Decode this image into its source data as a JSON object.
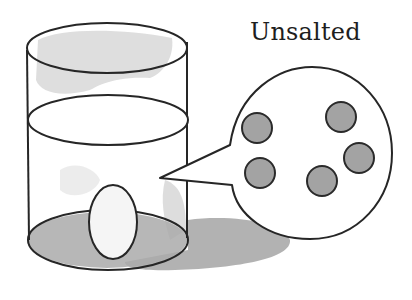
{
  "title": "Unsalted",
  "colors": {
    "background": "#ffffff",
    "outline": "#262626",
    "water_wash": "#d9d9d9",
    "shadow": "#9e9e9e",
    "bottom_fill": "#a8a8a8",
    "molecule_fill": "#a3a3a3",
    "egg_fill": "#f7f7f7"
  },
  "figure": {
    "glass": {
      "left": 27,
      "right": 188,
      "top_cy": 48,
      "water_cy": 120,
      "bottom_cy": 240
    },
    "egg": {
      "cx": 113,
      "cy": 222,
      "rx": 24,
      "ry": 37
    },
    "bubble": {
      "cx": 310,
      "cy": 153,
      "rx": 82,
      "ry": 86,
      "tail_tip": [
        160,
        178
      ]
    },
    "molecules": [
      {
        "cx": 257,
        "cy": 128,
        "r": 15
      },
      {
        "cx": 341,
        "cy": 117,
        "r": 15
      },
      {
        "cx": 359,
        "cy": 158,
        "r": 15
      },
      {
        "cx": 260,
        "cy": 173,
        "r": 15
      },
      {
        "cx": 322,
        "cy": 181,
        "r": 15
      }
    ]
  }
}
